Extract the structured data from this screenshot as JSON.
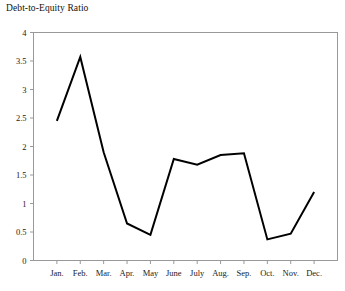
{
  "chart_data": {
    "type": "line",
    "title": "Debt-to-Equity Ratio",
    "xlabel": "",
    "ylabel": "",
    "categories": [
      "Jan.",
      "Feb.",
      "Mar.",
      "Apr.",
      "May",
      "June",
      "July",
      "Aug.",
      "Sep.",
      "Oct.",
      "Nov.",
      "Dec."
    ],
    "values": [
      2.45,
      3.57,
      1.9,
      0.65,
      0.45,
      1.78,
      1.68,
      1.85,
      1.88,
      0.37,
      0.47,
      1.2
    ],
    "ylim": [
      0,
      4
    ],
    "ytick_labels": [
      "0",
      "0.5",
      "1",
      "1.5",
      "2",
      "2.5",
      "3",
      "3.5",
      "4"
    ],
    "ytick_values": [
      0,
      0.5,
      1,
      1.5,
      2,
      2.5,
      3,
      3.5,
      4
    ],
    "grid": false,
    "legend": false,
    "line_color": "#000000",
    "axis_color": "#999999",
    "background_color": "#ffffff"
  }
}
